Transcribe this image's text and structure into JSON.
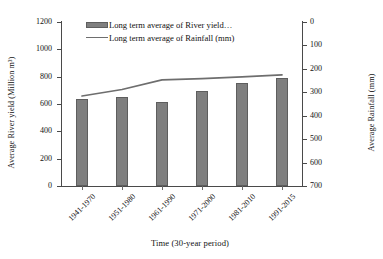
{
  "chart_data": {
    "type": "bar",
    "title": "",
    "xlabel": "Time (30-year period)",
    "ylabel": "Average River yield (Million m³)",
    "y2label": "Average Rainfall (mm)",
    "categories": [
      "1941-1970",
      "1951-1980",
      "1961-1990",
      "1971-2000",
      "1981-2010",
      "1991-2015"
    ],
    "series": [
      {
        "name": "Long term average of River yield…",
        "type": "bar",
        "axis": "left",
        "values": [
          640,
          651,
          616,
          697,
          755,
          787
        ]
      },
      {
        "name": "Long term average of Rainfall (mm)",
        "type": "line",
        "axis": "right",
        "values": [
          316,
          288,
          247,
          242,
          234,
          226
        ]
      }
    ],
    "ylim": [
      0,
      1200
    ],
    "yticks": [
      0,
      200,
      400,
      600,
      800,
      1000,
      1200
    ],
    "y2lim": [
      700,
      0
    ],
    "y2ticks": [
      0,
      100,
      200,
      300,
      400,
      500,
      600,
      700
    ],
    "y2_inverted": true,
    "grid": false,
    "legend_position": "top-center",
    "colors": {
      "bar_fill": "#7f7f7f",
      "bar_stroke": "#5e5e5e",
      "line": "#6e6e6e",
      "axis": "#4a4a4a",
      "text": "#111111",
      "background": "#ffffff"
    }
  },
  "axes": {
    "left_title": "Average River yield (Million m³)",
    "right_title": "Average Rainfall (mm)",
    "x_title": "Time (30-year period)",
    "left_ticks": [
      "1200",
      "1000",
      "800",
      "600",
      "400",
      "200",
      "0"
    ],
    "right_ticks": [
      "0",
      "100",
      "200",
      "300",
      "400",
      "500",
      "600",
      "700"
    ],
    "x_ticks": [
      "1941-1970",
      "1951-1980",
      "1961-1990",
      "1971-2000",
      "1981-2010",
      "1991-2015"
    ]
  },
  "legend": {
    "items": [
      {
        "label": "Long term average of River yield…",
        "marker": "bar-swatch"
      },
      {
        "label": "Long term average of Rainfall (mm)",
        "marker": "line-swatch"
      }
    ]
  }
}
